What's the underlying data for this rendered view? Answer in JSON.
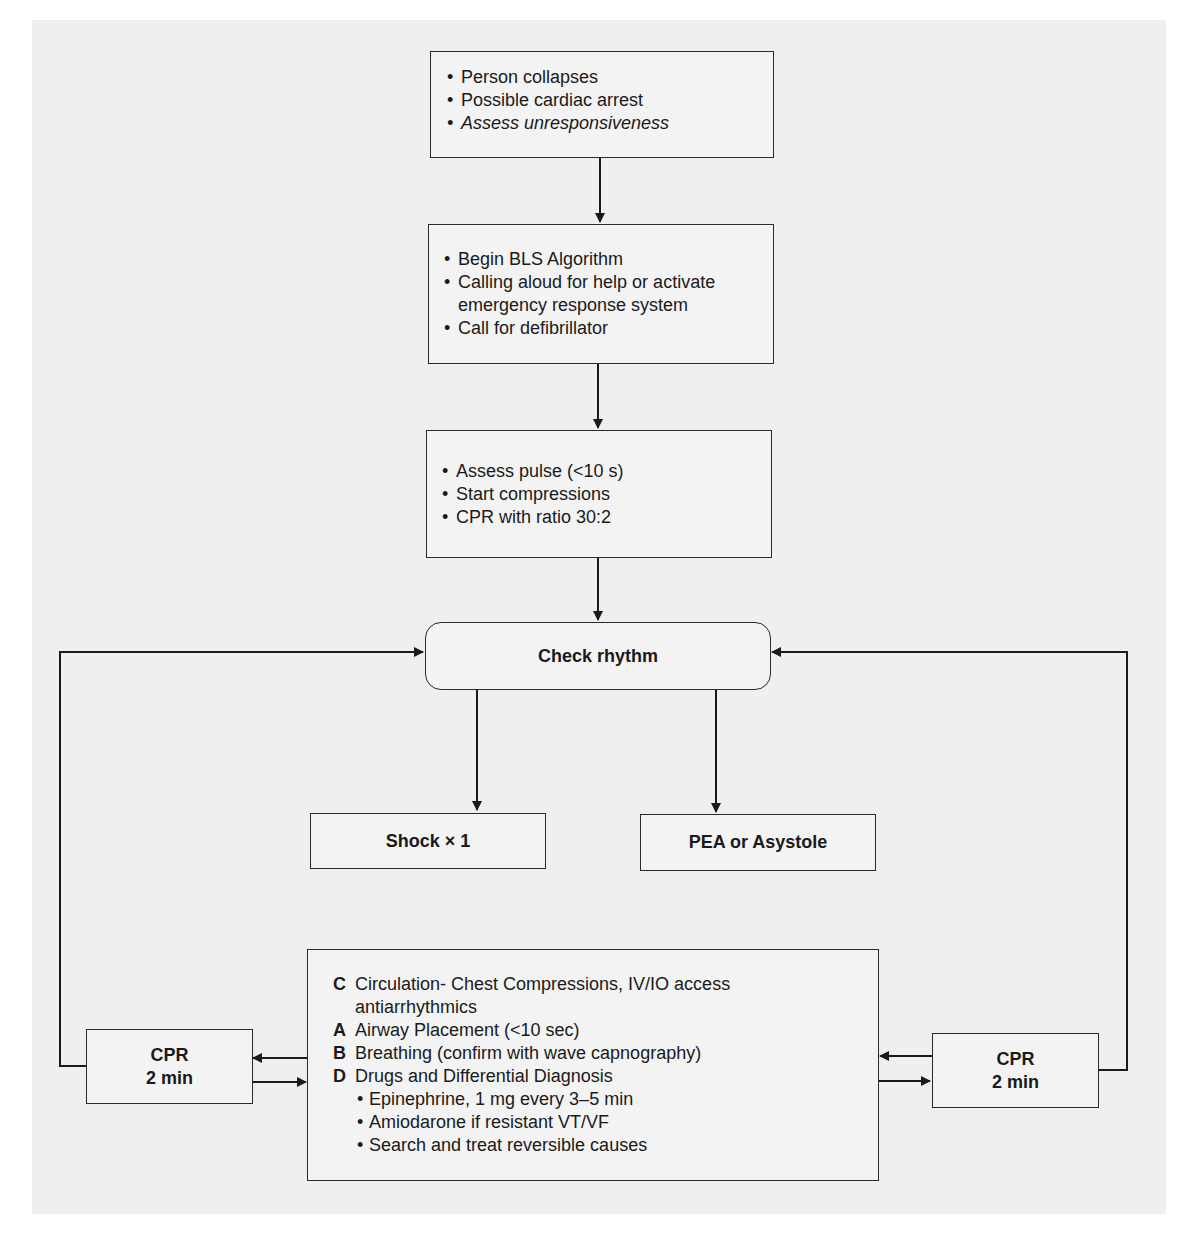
{
  "diagram": {
    "type": "flowchart",
    "colors": {
      "background_panel": "#efefef",
      "box_fill": "#f3f3f3",
      "line": "#1a1a1a"
    },
    "nodes": {
      "start": {
        "items": [
          "Person collapses",
          "Possible cardiac arrest",
          "Assess unresponsiveness"
        ],
        "italic_item_index": 2
      },
      "bls": {
        "items": [
          "Begin BLS Algorithm",
          "Calling aloud for help or activate",
          "emergency response system",
          "Call for defibrillator"
        ]
      },
      "assess": {
        "items": [
          "Assess pulse (<10 s)",
          "Start compressions",
          "CPR with ratio 30:2"
        ]
      },
      "check_rhythm": {
        "label": "Check rhythm"
      },
      "shock": {
        "label": "Shock × 1"
      },
      "pea": {
        "label": "PEA or Asystole"
      },
      "cabd": {
        "rows": [
          {
            "letter": "C",
            "text": "Circulation- Chest Compressions, IV/IO access"
          },
          {
            "letter": "",
            "text": "antiarrhythmics"
          },
          {
            "letter": "A",
            "text": "Airway Placement (<10 sec)"
          },
          {
            "letter": "B",
            "text": "Breathing (confirm with wave capnography)"
          },
          {
            "letter": "D",
            "text": "Drugs and Differential  Diagnosis"
          }
        ],
        "sub_items": [
          "Epinephrine, 1 mg every 3–5 min",
          "Amiodarone if resistant VT/VF",
          "Search and treat reversible causes"
        ]
      },
      "cpr_left": {
        "line1": "CPR",
        "line2": "2 min"
      },
      "cpr_right": {
        "line1": "CPR",
        "line2": "2 min"
      }
    },
    "edges": [
      [
        "start",
        "bls"
      ],
      [
        "bls",
        "assess"
      ],
      [
        "assess",
        "check_rhythm"
      ],
      [
        "check_rhythm",
        "shock"
      ],
      [
        "check_rhythm",
        "pea"
      ],
      [
        "cabd",
        "cpr_left"
      ],
      [
        "cpr_left",
        "cabd"
      ],
      [
        "cpr_left",
        "check_rhythm"
      ],
      [
        "cabd",
        "cpr_right"
      ],
      [
        "cpr_right",
        "cabd"
      ],
      [
        "cpr_right",
        "check_rhythm"
      ]
    ]
  }
}
